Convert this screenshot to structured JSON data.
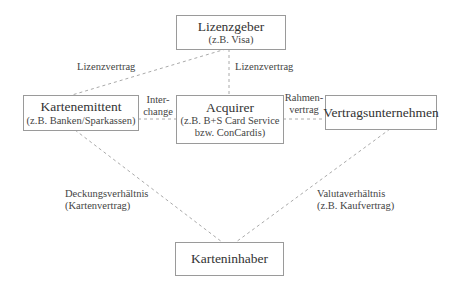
{
  "diagram": {
    "nodes": {
      "lizenzgeber": {
        "title": "Lizenzgeber",
        "subtitle": "(z.B. Visa)"
      },
      "kartenemittent": {
        "title": "Kartenemittent",
        "subtitle": "(z.B. Banken/Sparkassen)"
      },
      "acquirer": {
        "title": "Acquirer",
        "subtitle1": "(z.B. B+S Card Service",
        "subtitle2": "bzw. ConCardis)"
      },
      "vertragsunternehmen": {
        "title": "Vertragsunternehmen"
      },
      "karteninhaber": {
        "title": "Karteninhaber"
      }
    },
    "edges": {
      "lizenz_left": {
        "label": "Lizenzvertrag"
      },
      "lizenz_center": {
        "label": "Lizenzvertrag"
      },
      "interchange": {
        "line1": "Inter-",
        "line2": "change"
      },
      "rahmenvertrag": {
        "line1": "Rahmen-",
        "line2": "vertrag"
      },
      "deckung": {
        "line1": "Deckungsverhältnis",
        "line2": "(Kartenvertrag)"
      },
      "valuta": {
        "line1": "Valutaverhältnis",
        "line2": "(z.B. Kaufvertrag)"
      }
    },
    "colors": {
      "line": "#aaaaaa",
      "border": "#9a9a9a",
      "text": "#3a3a3a"
    }
  }
}
